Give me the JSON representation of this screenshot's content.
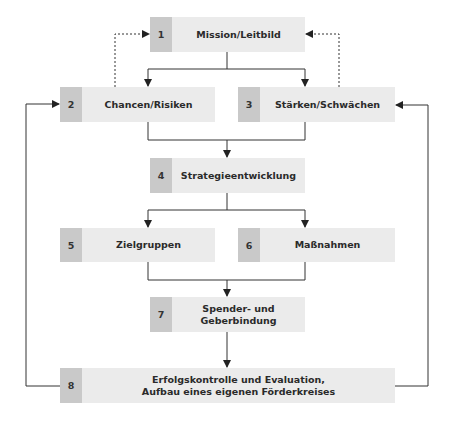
{
  "diagram": {
    "type": "flowchart",
    "colors": {
      "number_cell": "#c9c9c9",
      "label_cell": "#ebebeb",
      "line": "#333333"
    },
    "boxes": [
      {
        "num": "1",
        "label": "Mission/Leitbild"
      },
      {
        "num": "2",
        "label": "Chancen/Risiken"
      },
      {
        "num": "3",
        "label": "Stärken/Schwächen"
      },
      {
        "num": "4",
        "label": "Strategieentwicklung"
      },
      {
        "num": "5",
        "label": "Zielgruppen"
      },
      {
        "num": "6",
        "label": "Maßnahmen"
      },
      {
        "num": "7",
        "label": "Spender- und\nGeberbindung"
      },
      {
        "num": "8",
        "label": "Erfolgskontrolle und Evaluation,\nAufbau eines eigenen Förderkreises"
      }
    ],
    "edges": [
      {
        "from": "1",
        "to": "2",
        "style": "solid"
      },
      {
        "from": "1",
        "to": "3",
        "style": "solid"
      },
      {
        "from": "2",
        "to": "1",
        "style": "dashed"
      },
      {
        "from": "3",
        "to": "1",
        "style": "dashed"
      },
      {
        "from": "2",
        "to": "4",
        "style": "solid"
      },
      {
        "from": "3",
        "to": "4",
        "style": "solid"
      },
      {
        "from": "4",
        "to": "5",
        "style": "solid"
      },
      {
        "from": "4",
        "to": "6",
        "style": "solid"
      },
      {
        "from": "5",
        "to": "7",
        "style": "solid"
      },
      {
        "from": "6",
        "to": "7",
        "style": "solid"
      },
      {
        "from": "7",
        "to": "8",
        "style": "solid"
      },
      {
        "from": "8",
        "to": "2",
        "style": "solid"
      },
      {
        "from": "8",
        "to": "3",
        "style": "solid"
      }
    ]
  }
}
